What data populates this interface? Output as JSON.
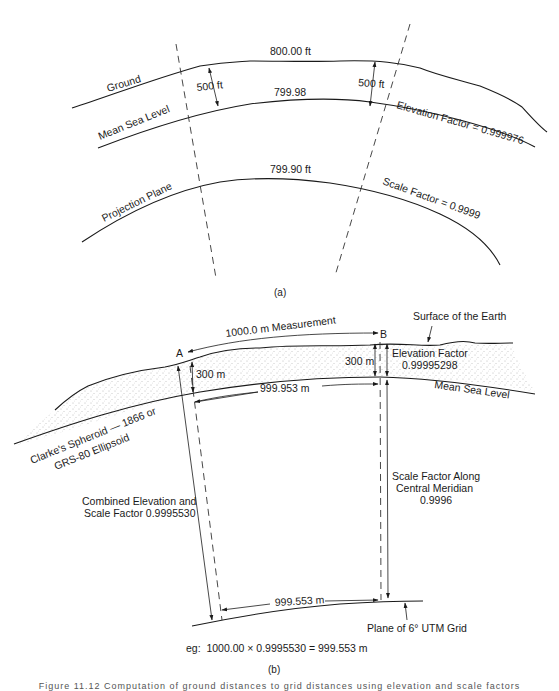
{
  "figure_a": {
    "label": "(a)",
    "curves": {
      "ground": "Ground",
      "mean_sea_level": "Mean Sea Level",
      "projection_plane": "Projection Plane"
    },
    "values": {
      "ground_distance": "800.00 ft",
      "msl_distance": "799.98",
      "projection_distance": "799.90 ft",
      "height_left": "500 ft",
      "height_right": "500 ft",
      "elevation_factor": "Elevation Factor = 0.999976",
      "scale_factor": "Scale Factor = 0.9999"
    }
  },
  "figure_b": {
    "label": "(b)",
    "points": {
      "a": "A",
      "b": "B"
    },
    "values": {
      "measurement": "1000.0 m Measurement",
      "surface_label": "Surface of the Earth",
      "height_a": "300 m",
      "height_b": "300 m",
      "elevation_factor_title": "Elevation Factor",
      "elevation_factor_value": "0.99995298",
      "msl_distance": "999.953 m",
      "mean_sea_level": "Mean Sea Level",
      "spheroid_line1": "Clarke's Spheroid — 1866 or",
      "spheroid_line2": "GRS-80 Ellipsoid",
      "combined_line1": "Combined Elevation and",
      "combined_line2": "Scale Factor 0.9995530",
      "scale_along_line1": "Scale Factor Along",
      "scale_along_line2": "Central Meridian",
      "scale_along_line3": "0.9996",
      "grid_distance": "999.553 m",
      "grid_plane": "Plane of 6° UTM Grid",
      "example": "eg:  1000.00 × 0.9995530 = 999.553 m"
    }
  },
  "caption": "Figure 11.12   Computation of ground distances to grid distances using elevation and scale factors"
}
